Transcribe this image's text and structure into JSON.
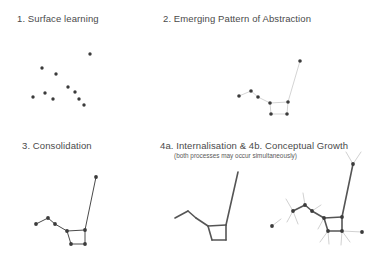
{
  "figure": {
    "background_color": "#ffffff",
    "ink_color": "#3b3b3b",
    "faint_line_color": "#cfcfcf",
    "width": 386,
    "height": 264
  },
  "panels": [
    {
      "id": "panel-1",
      "title": "1. Surface learning",
      "subtitle": null
    },
    {
      "id": "panel-2",
      "title": "2. Emerging Pattern of Abstraction",
      "subtitle": null
    },
    {
      "id": "panel-3",
      "title": "3. Consolidation",
      "subtitle": null
    },
    {
      "id": "panel-4",
      "title": "4a. Internalisation  &  4b. Conceptual Growth",
      "subtitle": "(both processes may occur simultaneously)"
    }
  ],
  "chart_data": {
    "type": "scatter",
    "xlabel": "",
    "ylabel": "",
    "grid": false,
    "legend": false,
    "xlim": [
      0,
      386
    ],
    "ylim": [
      0,
      264
    ],
    "note": "Coordinates are in screenshot pixel space, y measured downward.",
    "panels": [
      {
        "name": "1. Surface learning",
        "description": "Ten isolated dots, no connecting lines.",
        "dots": [
          [
            90,
            54
          ],
          [
            42,
            68
          ],
          [
            56,
            74
          ],
          [
            68,
            87
          ],
          [
            33,
            97
          ],
          [
            45,
            93
          ],
          [
            53,
            99
          ],
          [
            75,
            92
          ],
          [
            79,
            99
          ],
          [
            84,
            105
          ]
        ],
        "lines": []
      },
      {
        "name": "2. Emerging Pattern of Abstraction",
        "description": "Dots joined by thin faint lines forming a chain that drops into a small quadrilateral and rises steeply to an upper-right dot.",
        "dots": [
          [
            239,
            96
          ],
          [
            251,
            91
          ],
          [
            258,
            97
          ],
          [
            270,
            103
          ],
          [
            288,
            102
          ],
          [
            271,
            114
          ],
          [
            287,
            114
          ],
          [
            300,
            61
          ]
        ],
        "lines": [
          [
            [
              239,
              96
            ],
            [
              251,
              91
            ]
          ],
          [
            [
              251,
              91
            ],
            [
              258,
              97
            ]
          ],
          [
            [
              258,
              97
            ],
            [
              270,
              103
            ]
          ],
          [
            [
              270,
              103
            ],
            [
              288,
              102
            ]
          ],
          [
            [
              270,
              103
            ],
            [
              271,
              114
            ]
          ],
          [
            [
              271,
              114
            ],
            [
              287,
              114
            ]
          ],
          [
            [
              287,
              114
            ],
            [
              288,
              102
            ]
          ],
          [
            [
              288,
              102
            ],
            [
              300,
              61
            ]
          ]
        ]
      },
      {
        "name": "3. Consolidation",
        "description": "Same topology as panel 2 but drawn with darker, firmer lines; the structure is compacted.",
        "dots": [
          [
            36,
            224
          ],
          [
            48,
            218
          ],
          [
            55,
            224
          ],
          [
            67,
            231
          ],
          [
            85,
            230
          ],
          [
            71,
            244
          ],
          [
            85,
            244
          ],
          [
            96,
            177
          ]
        ],
        "lines": [
          [
            [
              36,
              224
            ],
            [
              48,
              218
            ]
          ],
          [
            [
              48,
              218
            ],
            [
              55,
              224
            ]
          ],
          [
            [
              55,
              224
            ],
            [
              67,
              231
            ]
          ],
          [
            [
              67,
              231
            ],
            [
              85,
              230
            ]
          ],
          [
            [
              67,
              231
            ],
            [
              71,
              244
            ]
          ],
          [
            [
              71,
              244
            ],
            [
              85,
              244
            ]
          ],
          [
            [
              85,
              244
            ],
            [
              85,
              230
            ]
          ],
          [
            [
              85,
              230
            ],
            [
              96,
              177
            ]
          ]
        ]
      },
      {
        "name": "4a. Internalisation",
        "description": "The consolidated figure with the dots removed - only the internalised skeleton of lines remains.",
        "dots": [],
        "lines": [
          [
            [
              175,
              218
            ],
            [
              188,
              211
            ]
          ],
          [
            [
              188,
              211
            ],
            [
              196,
              218
            ]
          ],
          [
            [
              196,
              218
            ],
            [
              208,
              226
            ]
          ],
          [
            [
              208,
              226
            ],
            [
              226,
              225
            ]
          ],
          [
            [
              208,
              226
            ],
            [
              212,
              240
            ]
          ],
          [
            [
              212,
              240
            ],
            [
              226,
              240
            ]
          ],
          [
            [
              226,
              240
            ],
            [
              226,
              225
            ]
          ],
          [
            [
              226,
              225
            ],
            [
              238,
              172
            ]
          ]
        ]
      },
      {
        "name": "4b. Conceptual Growth",
        "description": "The consolidated figure with dots, plus faint new branches radiating outward from nodes and a forked growth at the top of the stem; extra outlying dots mark new concepts.",
        "dots": [
          [
            293,
            211
          ],
          [
            305,
            205
          ],
          [
            312,
            211
          ],
          [
            324,
            218
          ],
          [
            342,
            217
          ],
          [
            328,
            231
          ],
          [
            342,
            231
          ],
          [
            353,
            164
          ],
          [
            272,
            226
          ],
          [
            362,
            232
          ]
        ],
        "lines": [
          [
            [
              293,
              211
            ],
            [
              305,
              205
            ]
          ],
          [
            [
              305,
              205
            ],
            [
              312,
              211
            ]
          ],
          [
            [
              312,
              211
            ],
            [
              324,
              218
            ]
          ],
          [
            [
              324,
              218
            ],
            [
              342,
              217
            ]
          ],
          [
            [
              324,
              218
            ],
            [
              328,
              231
            ]
          ],
          [
            [
              328,
              231
            ],
            [
              342,
              231
            ]
          ],
          [
            [
              342,
              231
            ],
            [
              342,
              217
            ]
          ],
          [
            [
              342,
              217
            ],
            [
              353,
              164
            ]
          ]
        ],
        "growth_lines": [
          [
            [
              353,
              164
            ],
            [
              346,
              152
            ]
          ],
          [
            [
              353,
              164
            ],
            [
              361,
              152
            ]
          ],
          [
            [
              293,
              211
            ],
            [
              286,
              199
            ]
          ],
          [
            [
              293,
              211
            ],
            [
              287,
              222
            ]
          ],
          [
            [
              293,
              211
            ],
            [
              298,
              224
            ]
          ],
          [
            [
              305,
              205
            ],
            [
              303,
              193
            ]
          ],
          [
            [
              312,
              211
            ],
            [
              321,
              205
            ]
          ],
          [
            [
              324,
              218
            ],
            [
              318,
              229
            ]
          ],
          [
            [
              328,
              231
            ],
            [
              320,
              242
            ]
          ],
          [
            [
              328,
              231
            ],
            [
              329,
              244
            ]
          ],
          [
            [
              342,
              231
            ],
            [
              350,
              242
            ]
          ],
          [
            [
              342,
              231
            ],
            [
              341,
              245
            ]
          ],
          [
            [
              342,
              231
            ],
            [
              362,
              232
            ]
          ],
          [
            [
              272,
              226
            ],
            [
              281,
              219
            ]
          ]
        ]
      }
    ]
  }
}
